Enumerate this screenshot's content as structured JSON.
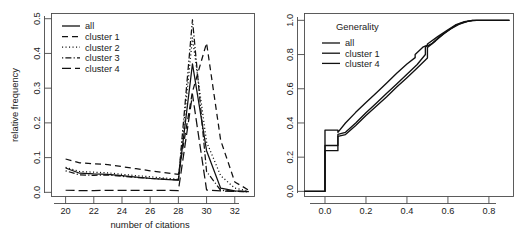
{
  "figure": {
    "background": "#ffffff",
    "line_color": "#111111",
    "axis_color": "#4a4a4a",
    "panels": [
      "left",
      "right"
    ]
  },
  "chart_data": [
    {
      "type": "line",
      "panel": "left",
      "title": "",
      "xlabel": "number of citations",
      "ylabel": "relative frequency",
      "xlim": [
        19.0,
        33.4
      ],
      "ylim": [
        -0.012,
        0.515
      ],
      "xticks": [
        20,
        22,
        24,
        26,
        28,
        30,
        32
      ],
      "xtick_labels": [
        "20",
        "22",
        "24",
        "26",
        "28",
        "30",
        "32"
      ],
      "yticks": [
        0.0,
        0.1,
        0.2,
        0.3,
        0.4,
        0.5
      ],
      "ytick_labels": [
        "0.0",
        "0.1",
        "0.2",
        "0.3",
        "0.4",
        "0.5"
      ],
      "grid": false,
      "legend_position": "top-left",
      "legend_title": "",
      "x": [
        20,
        21,
        22,
        23,
        24,
        25,
        26,
        27,
        28,
        29,
        30,
        31,
        32,
        33
      ],
      "series": [
        {
          "name": "all",
          "linestyle": "solid",
          "dash": "none",
          "values": [
            0.07,
            0.055,
            0.053,
            0.052,
            0.048,
            0.044,
            0.04,
            0.037,
            0.035,
            0.37,
            0.12,
            0.012,
            0.004,
            0.002
          ]
        },
        {
          "name": "cluster 1",
          "linestyle": "dashed",
          "dash": "6,4",
          "values": [
            0.096,
            0.085,
            0.082,
            0.08,
            0.074,
            0.068,
            0.062,
            0.057,
            0.052,
            0.29,
            0.43,
            0.15,
            0.03,
            0.006
          ]
        },
        {
          "name": "cluster 2",
          "linestyle": "dotted",
          "dash": "1.1,2.4",
          "values": [
            0.072,
            0.06,
            0.058,
            0.056,
            0.052,
            0.048,
            0.045,
            0.041,
            0.038,
            0.445,
            0.145,
            0.048,
            0.012,
            0.004
          ]
        },
        {
          "name": "cluster 3",
          "linestyle": "dotdash",
          "dash": "1.2,2.2,6,2.2",
          "values": [
            0.062,
            0.05,
            0.049,
            0.05,
            0.046,
            0.043,
            0.04,
            0.038,
            0.036,
            0.497,
            0.06,
            0.006,
            0.003,
            0.002
          ]
        },
        {
          "name": "cluster 4",
          "linestyle": "longdash",
          "dash": "9,4",
          "values": [
            0.006,
            0.005,
            0.005,
            0.006,
            0.006,
            0.006,
            0.006,
            0.006,
            0.005,
            0.282,
            0.007,
            0.004,
            0.003,
            0.002
          ]
        }
      ]
    },
    {
      "type": "line",
      "panel": "right",
      "title": "",
      "xlabel": "",
      "ylabel": "",
      "xlim": [
        -0.1,
        0.92
      ],
      "ylim": [
        -0.03,
        1.04
      ],
      "xticks": [
        0.0,
        0.2,
        0.4,
        0.6,
        0.8
      ],
      "xtick_labels": [
        "0.0",
        "0.2",
        "0.4",
        "0.6",
        "0.8"
      ],
      "yticks": [
        0.0,
        0.2,
        0.4,
        0.6,
        0.8,
        1.0
      ],
      "ytick_labels": [
        "0.0",
        "0.2",
        "0.4",
        "0.6",
        "0.8",
        "1.0"
      ],
      "grid": false,
      "legend_position": "top-left",
      "legend_title": "Generality",
      "description": "empirical cumulative distribution function of generality",
      "series": [
        {
          "name": "all",
          "linestyle": "solid",
          "x": [
            -0.1,
            0.0,
            0.0,
            0.063,
            0.063,
            0.1,
            0.15,
            0.2,
            0.25,
            0.3,
            0.35,
            0.4,
            0.44,
            0.44,
            0.48,
            0.5,
            0.5,
            0.55,
            0.6,
            0.64,
            0.68,
            0.72,
            0.8,
            0.9
          ],
          "values": [
            0.0,
            0.0,
            0.358,
            0.358,
            0.345,
            0.4,
            0.462,
            0.52,
            0.575,
            0.632,
            0.69,
            0.745,
            0.782,
            0.8,
            0.845,
            0.855,
            0.862,
            0.905,
            0.945,
            0.975,
            0.992,
            1.0,
            1.0,
            1.0
          ]
        },
        {
          "name": "cluster 1",
          "linestyle": "solid",
          "x": [
            -0.1,
            0.0,
            0.0,
            0.063,
            0.063,
            0.1,
            0.15,
            0.2,
            0.25,
            0.3,
            0.35,
            0.4,
            0.45,
            0.49,
            0.49,
            0.52,
            0.56,
            0.6,
            0.64,
            0.68,
            0.72,
            0.8,
            0.9
          ],
          "values": [
            0.0,
            0.0,
            0.268,
            0.268,
            0.333,
            0.345,
            0.4,
            0.46,
            0.515,
            0.572,
            0.628,
            0.685,
            0.742,
            0.8,
            0.845,
            0.862,
            0.905,
            0.94,
            0.972,
            0.99,
            1.0,
            1.0,
            1.0
          ]
        },
        {
          "name": "cluster 4",
          "linestyle": "solid",
          "x": [
            -0.1,
            0.0,
            0.0,
            0.063,
            0.063,
            0.1,
            0.15,
            0.2,
            0.25,
            0.3,
            0.35,
            0.4,
            0.45,
            0.5,
            0.5,
            0.54,
            0.58,
            0.62,
            0.66,
            0.7,
            0.74,
            0.82,
            0.9
          ],
          "values": [
            0.0,
            0.0,
            0.238,
            0.238,
            0.322,
            0.332,
            0.385,
            0.443,
            0.498,
            0.552,
            0.61,
            0.665,
            0.722,
            0.78,
            0.842,
            0.88,
            0.922,
            0.955,
            0.98,
            0.995,
            1.0,
            1.0,
            1.0
          ]
        }
      ]
    }
  ],
  "left_panel": {
    "axis_x_label": "number of citations",
    "axis_y_label": "relative frequency",
    "xtick_labels": [
      "20",
      "22",
      "24",
      "26",
      "28",
      "30",
      "32"
    ],
    "ytick_labels": [
      "0.0",
      "0.1",
      "0.2",
      "0.3",
      "0.4",
      "0.5"
    ],
    "legend": {
      "title": "",
      "items": [
        {
          "label": "all",
          "style": "solid"
        },
        {
          "label": "cluster 1",
          "style": "dashed"
        },
        {
          "label": "cluster 2",
          "style": "dotted"
        },
        {
          "label": "cluster 3",
          "style": "dotdash"
        },
        {
          "label": "cluster 4",
          "style": "longdash"
        }
      ]
    }
  },
  "right_panel": {
    "axis_x_label": "",
    "axis_y_label": "",
    "xtick_labels": [
      "0.0",
      "0.2",
      "0.4",
      "0.6",
      "0.8"
    ],
    "ytick_labels": [
      "0.0",
      "0.2",
      "0.4",
      "0.6",
      "0.8",
      "1.0"
    ],
    "legend": {
      "title": "Generality",
      "items": [
        {
          "label": "all",
          "style": "solid"
        },
        {
          "label": "cluster 1",
          "style": "solid"
        },
        {
          "label": "cluster 4",
          "style": "solid"
        }
      ]
    }
  }
}
